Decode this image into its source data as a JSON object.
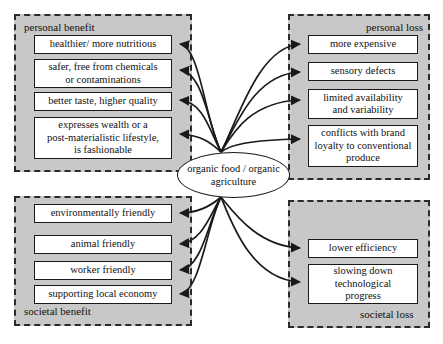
{
  "diagram": {
    "center": {
      "line1": "organic food /",
      "line2": "organic agriculture"
    },
    "panels": [
      {
        "key": "personal-benefit",
        "label": "personal benefit",
        "label_position": "top-left",
        "nodes": [
          {
            "lines": [
              "healthier/ more nutritious"
            ]
          },
          {
            "lines": [
              "safer, free from chemicals",
              "or contaminations"
            ]
          },
          {
            "lines": [
              "better taste, higher quality"
            ]
          },
          {
            "lines": [
              "expresses wealth or a",
              "post-materialistic lifestyle,",
              "is fashionable"
            ]
          }
        ]
      },
      {
        "key": "personal-loss",
        "label": "personal loss",
        "label_position": "top-right",
        "nodes": [
          {
            "lines": [
              "more expensive"
            ]
          },
          {
            "lines": [
              "sensory defects"
            ]
          },
          {
            "lines": [
              "limited availability",
              "and variability"
            ]
          },
          {
            "lines": [
              "conflicts with brand",
              "loyalty to conventional produce"
            ]
          }
        ]
      },
      {
        "key": "societal-benefit",
        "label": "societal benefit",
        "label_position": "bottom-left",
        "nodes": [
          {
            "lines": [
              "environmentally friendly"
            ]
          },
          {
            "lines": [
              "animal friendly"
            ]
          },
          {
            "lines": [
              "worker friendly"
            ]
          },
          {
            "lines": [
              "supporting local economy"
            ]
          }
        ]
      },
      {
        "key": "societal-loss",
        "label": "societal loss",
        "label_position": "bottom-right",
        "nodes": [
          {
            "lines": [
              "lower efficiency"
            ]
          },
          {
            "lines": [
              "slowing down",
              "technological",
              "progress"
            ]
          }
        ]
      }
    ],
    "colors": {
      "panel_fill": "#c8c8c8",
      "panel_border": "#2b2b2b",
      "node_fill": "#ffffff",
      "node_border": "#1a1a1a",
      "edge": "#1a1a1a",
      "page": "#ffffff"
    }
  }
}
